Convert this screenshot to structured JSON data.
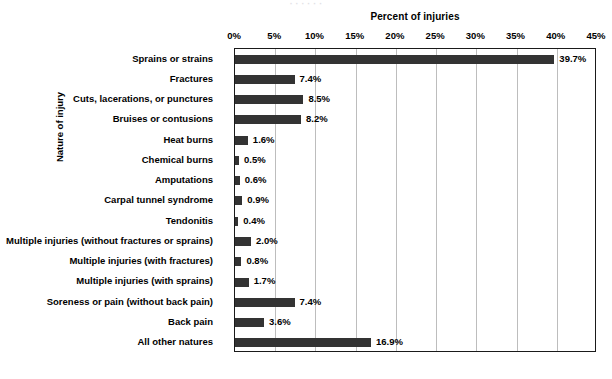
{
  "top_clipped_text": "· · · · · ·",
  "axis": {
    "x_title": "Percent of injuries",
    "y_title": "Nature of injury"
  },
  "chart_data": {
    "type": "bar",
    "orientation": "horizontal",
    "title": "Percent of injuries",
    "xlabel": "Percent of injuries",
    "ylabel": "Nature of injury",
    "xlim": [
      0,
      45
    ],
    "grid": true,
    "legend": null,
    "tick_labels": [
      "0%",
      "5%",
      "10%",
      "15%",
      "20%",
      "25%",
      "30%",
      "35%",
      "40%",
      "45%"
    ],
    "tick_values": [
      0,
      5,
      10,
      15,
      20,
      25,
      30,
      35,
      40,
      45
    ],
    "bar_color": "#333333",
    "categories": [
      "Sprains or strains",
      "Fractures",
      "Cuts, lacerations, or punctures",
      "Bruises or contusions",
      "Heat burns",
      "Chemical burns",
      "Amputations",
      "Carpal tunnel syndrome",
      "Tendonitis",
      "Multiple injuries (without fractures or sprains)",
      "Multiple injuries (with fractures)",
      "Multiple injuries (with sprains)",
      "Soreness or pain (without back pain)",
      "Back pain",
      "All other natures"
    ],
    "values": [
      39.7,
      7.4,
      8.5,
      8.2,
      1.6,
      0.5,
      0.6,
      0.9,
      0.4,
      2.0,
      0.8,
      1.7,
      7.4,
      3.6,
      16.9
    ],
    "value_labels": [
      "39.7%",
      "7.4%",
      "8.5%",
      "8.2%",
      "1.6%",
      "0.5%",
      "0.6%",
      "0.9%",
      "0.4%",
      "2.0%",
      "0.8%",
      "1.7%",
      "7.4%",
      "3.6%",
      "16.9%"
    ]
  }
}
